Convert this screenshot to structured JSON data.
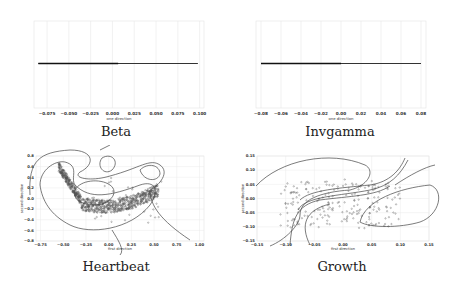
{
  "chart_data": [
    {
      "type": "line",
      "title": "Beta",
      "xlabel": "one direction",
      "ylabel": "",
      "x_ticks": [
        "-0.075",
        "-0.050",
        "-0.025",
        "0.000",
        "0.025",
        "0.050",
        "0.075",
        "0.100"
      ],
      "xlim": [
        -0.09,
        0.105
      ],
      "grid": true,
      "series": [
        {
          "name": "projection",
          "x": [
            -0.085,
            0.098
          ],
          "y": [
            0,
            0
          ]
        }
      ]
    },
    {
      "type": "line",
      "title": "Invgamma",
      "xlabel": "one direction",
      "ylabel": "",
      "x_ticks": [
        "-0.08",
        "-0.06",
        "-0.04",
        "-0.02",
        "0.00",
        "0.02",
        "0.04",
        "0.06",
        "0.08"
      ],
      "xlim": [
        -0.085,
        0.085
      ],
      "grid": true,
      "series": [
        {
          "name": "projection",
          "x": [
            -0.08,
            0.08
          ],
          "y": [
            0,
            0
          ]
        }
      ]
    },
    {
      "type": "scatter",
      "title": "Heartbeat",
      "xlabel": "first direction",
      "ylabel": "second direction",
      "x_ticks": [
        "-0.75",
        "-0.50",
        "-0.25",
        "0.00",
        "0.25",
        "0.50",
        "0.75",
        "1.00"
      ],
      "y_ticks": [
        "0.8",
        "0.6",
        "0.4",
        "0.2",
        "0.0",
        "-0.2",
        "-0.4",
        "-0.6",
        "-0.8"
      ],
      "xlim": [
        -0.8,
        1.05
      ],
      "ylim": [
        -0.8,
        0.8
      ],
      "grid": true,
      "overlay": "density contours"
    },
    {
      "type": "scatter",
      "title": "Growth",
      "xlabel": "first direction",
      "ylabel": "second direction",
      "x_ticks": [
        "-0.15",
        "-0.10",
        "-0.05",
        "0.00",
        "0.05",
        "0.10",
        "0.15"
      ],
      "y_ticks": [
        "0.15",
        "0.10",
        "0.05",
        "0.00",
        "-0.05",
        "-0.10",
        "-0.15"
      ],
      "xlim": [
        -0.15,
        0.15
      ],
      "ylim": [
        -0.15,
        0.15
      ],
      "grid": true,
      "overlay": "density contours"
    }
  ],
  "captions": {
    "beta": "Beta",
    "invgamma": "Invgamma",
    "heartbeat": "Heartbeat",
    "growth": "Growth"
  }
}
